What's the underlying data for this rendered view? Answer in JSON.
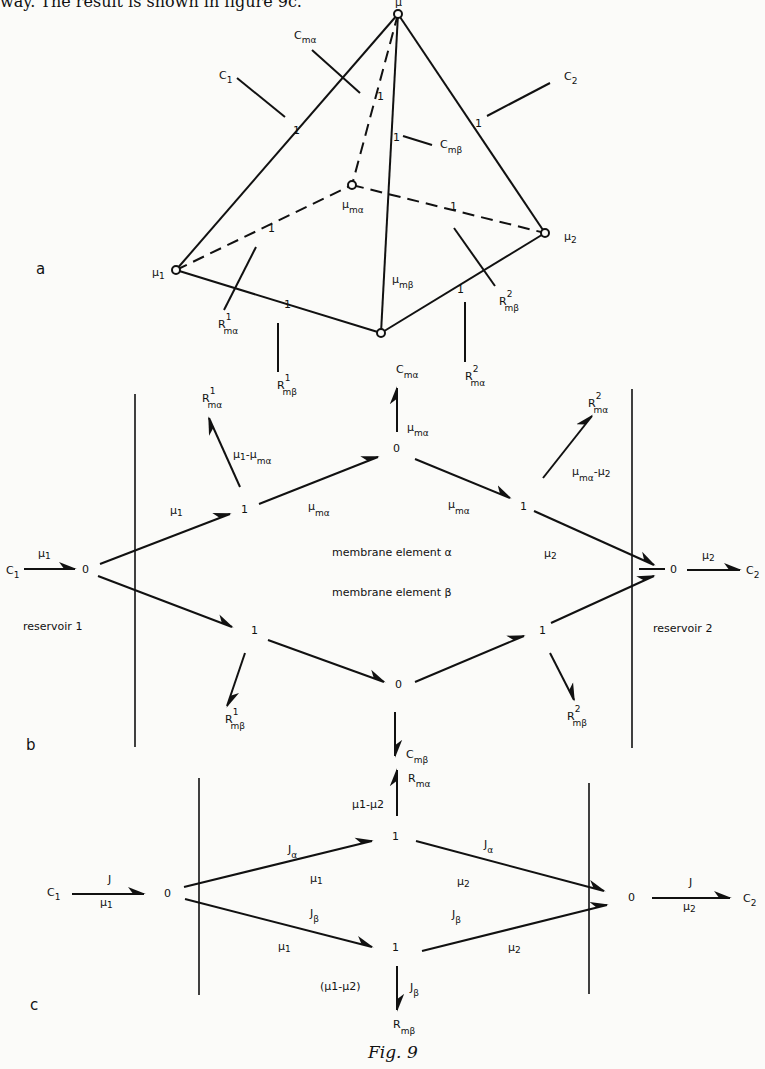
{
  "header_text": "way. The result is shown in figure 9c.",
  "caption": "Fig. 9",
  "panels": {
    "a": {
      "label": "a",
      "nodes": {
        "apex": "μ",
        "mu1": "μ",
        "mu1_sub": "1",
        "mu2": "μ",
        "mu2_sub": "2",
        "mu_ma": "μ",
        "mu_ma_sub": "mα",
        "mu_mb": "μ",
        "mu_mb_sub": "mβ",
        "one": "1"
      },
      "labels": {
        "C1": "C",
        "C1_sub": "1",
        "C2": "C",
        "C2_sub": "2",
        "Cma": "C",
        "Cma_sub": "mα",
        "Cmb": "C",
        "Cmb_sub": "mβ",
        "Rma1": "R",
        "Rma1_sup": "1",
        "Rma1_sub": "mα",
        "Rmb1": "R",
        "Rmb1_sup": "1",
        "Rmb1_sub": "mβ",
        "Rma2": "R",
        "Rma2_sup": "2",
        "Rma2_sub": "mα",
        "Rmb2": "R",
        "Rmb2_sup": "2",
        "Rmb2_sub": "mβ"
      }
    },
    "b": {
      "label": "b",
      "junction_zero": "0",
      "junction_one": "1",
      "membrane_alpha": "membrane element α",
      "membrane_beta": "membrane element β",
      "reservoir1": "reservoir 1",
      "reservoir2": "reservoir 2",
      "C1": "C",
      "C1_sub": "1",
      "C2": "C",
      "C2_sub": "2",
      "mu": "μ",
      "sub1": "1",
      "sub2": "2",
      "sub_ma": "mα",
      "sub_mb": "mβ",
      "minus": "-",
      "R": "R",
      "C": "C",
      "sup1": "1",
      "sup2": "2"
    },
    "c": {
      "label": "c",
      "J": "J",
      "J_alpha_sub": "α",
      "J_beta_sub": "β",
      "mu": "μ",
      "sub1": "1",
      "sub2": "2",
      "mu1_minus_mu2": "μ1-μ2",
      "paren_mu1_minus_mu2": "(μ1-μ2)",
      "junction_zero": "0",
      "junction_one": "1",
      "C1": "C",
      "C1_sub": "1",
      "C2": "C",
      "C2_sub": "2",
      "R": "R",
      "sub_ma": "mα",
      "sub_mb": "mβ"
    }
  }
}
